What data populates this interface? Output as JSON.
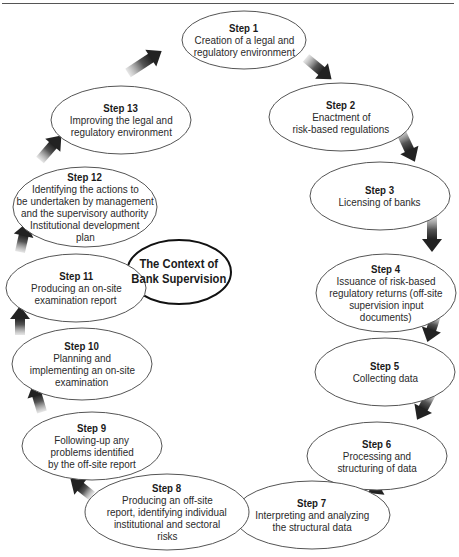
{
  "diagram": {
    "center": {
      "line1": "The Context of",
      "line2": "Bank Supervision",
      "cx": 179,
      "cy": 272,
      "rx": 52,
      "ry": 32
    },
    "steps": [
      {
        "title": "Step 1",
        "lines": [
          "Creation of a legal and",
          "regulatory environment"
        ],
        "cx": 244,
        "cy": 40,
        "rx": 62,
        "ry": 29
      },
      {
        "title": "Step 2",
        "lines": [
          "Enactment of",
          "risk-based regulations"
        ],
        "cx": 341,
        "cy": 117,
        "rx": 72,
        "ry": 34
      },
      {
        "title": "Step 3",
        "lines": [
          "Licensing of banks"
        ],
        "cx": 380,
        "cy": 196,
        "rx": 70,
        "ry": 34
      },
      {
        "title": "Step 4",
        "lines": [
          "Issuance of risk-based",
          "regulatory returns (off-site",
          "supervision input",
          "documents)"
        ],
        "cx": 386,
        "cy": 293,
        "rx": 70,
        "ry": 39
      },
      {
        "title": "Step 5",
        "lines": [
          "Collecting data"
        ],
        "cx": 385,
        "cy": 372,
        "rx": 70,
        "ry": 34
      },
      {
        "title": "Step 6",
        "lines": [
          "Processing and",
          "structuring of data"
        ],
        "cx": 377,
        "cy": 456,
        "rx": 70,
        "ry": 34
      },
      {
        "title": "Step 7",
        "lines": [
          "Interpreting and analyzing",
          "the structural data"
        ],
        "cx": 312,
        "cy": 515,
        "rx": 78,
        "ry": 34
      },
      {
        "title": "Step 8",
        "lines": [
          "Producing an off-site",
          "report, identifying individual",
          "institutional and sectoral",
          "risks"
        ],
        "cx": 167,
        "cy": 512,
        "rx": 82,
        "ry": 38
      },
      {
        "title": "Step 9",
        "lines": [
          "Following-up any",
          "problems identified",
          "by the off-site report"
        ],
        "cx": 92,
        "cy": 446,
        "rx": 70,
        "ry": 34
      },
      {
        "title": "Step 10",
        "lines": [
          "Planning and",
          "implementing an on-site",
          "examination"
        ],
        "cx": 82,
        "cy": 364,
        "rx": 70,
        "ry": 36
      },
      {
        "title": "Step 11",
        "lines": [
          "Producing an on-site",
          "examination report"
        ],
        "cx": 76,
        "cy": 288,
        "rx": 70,
        "ry": 34
      },
      {
        "title": "Step 12",
        "lines": [
          "Identifying the actions to",
          "be undertaken by management",
          "and the supervisory authority",
          "Institutional development",
          "plan"
        ],
        "cx": 85,
        "cy": 207,
        "rx": 72,
        "ry": 40
      },
      {
        "title": "Step 13",
        "lines": [
          "Improving the legal and",
          "regulatory environment"
        ],
        "cx": 121,
        "cy": 120,
        "rx": 70,
        "ry": 34
      }
    ],
    "arrows": [
      {
        "from": "Step 13",
        "to": "Step 1",
        "x1": 128,
        "y1": 73,
        "x2": 160,
        "y2": 52
      },
      {
        "from": "Step 1",
        "to": "Step 2",
        "x1": 306,
        "y1": 58,
        "x2": 330,
        "y2": 78
      },
      {
        "from": "Step 2",
        "to": "Step 3",
        "x1": 400,
        "y1": 130,
        "x2": 414,
        "y2": 160
      },
      {
        "from": "Step 3",
        "to": "Step 4",
        "x1": 432,
        "y1": 214,
        "x2": 432,
        "y2": 250
      },
      {
        "from": "Step 4",
        "to": "Step 5",
        "x1": 436,
        "y1": 315,
        "x2": 428,
        "y2": 340
      },
      {
        "from": "Step 5",
        "to": "Step 6",
        "x1": 432,
        "y1": 392,
        "x2": 418,
        "y2": 418
      },
      {
        "from": "Step 6",
        "to": "Step 7",
        "x1": 396,
        "y1": 476,
        "x2": 370,
        "y2": 492
      },
      {
        "from": "Step 7",
        "to": "Step 8",
        "x1": 248,
        "y1": 519,
        "x2": 220,
        "y2": 519
      },
      {
        "from": "Step 8",
        "to": "Step 9",
        "x1": 92,
        "y1": 496,
        "x2": 72,
        "y2": 480
      },
      {
        "from": "Step 9",
        "to": "Step 10",
        "x1": 42,
        "y1": 412,
        "x2": 34,
        "y2": 385
      },
      {
        "from": "Step 10",
        "to": "Step 11",
        "x1": 20,
        "y1": 335,
        "x2": 20,
        "y2": 308
      },
      {
        "from": "Step 11",
        "to": "Step 12",
        "x1": 20,
        "y1": 252,
        "x2": 26,
        "y2": 225
      },
      {
        "from": "Step 12",
        "to": "Step 13",
        "x1": 40,
        "y1": 160,
        "x2": 60,
        "y2": 137
      }
    ]
  },
  "colors": {
    "ellipse_stroke": "#555555",
    "center_stroke": "#111111",
    "arrow_dark": "#222222",
    "arrow_light": "#cccccc",
    "rule": "#555555"
  }
}
